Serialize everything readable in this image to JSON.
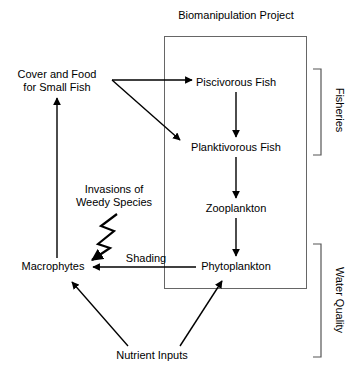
{
  "diagram": {
    "title": "Biomanipulation Project",
    "nodes": [
      {
        "id": "cover_food",
        "label": "Cover and Food\nfor Small Fish",
        "x": 57,
        "y": 81
      },
      {
        "id": "invasions",
        "label": "Invasions of\nWeedy Species",
        "x": 114,
        "y": 196
      },
      {
        "id": "macrophytes",
        "label": "Macrophytes",
        "x": 53,
        "y": 266
      },
      {
        "id": "nutrient_inputs",
        "label": "Nutrient Inputs",
        "x": 152,
        "y": 355
      },
      {
        "id": "piscivorous",
        "label": "Piscivorous Fish",
        "x": 236,
        "y": 82
      },
      {
        "id": "planktivorous",
        "label": "Planktivorous Fish",
        "x": 236,
        "y": 147
      },
      {
        "id": "zooplankton",
        "label": "Zooplankton",
        "x": 236,
        "y": 208
      },
      {
        "id": "phytoplankton",
        "label": "Phytoplankton",
        "x": 236,
        "y": 266
      }
    ],
    "edge_labels": [
      {
        "id": "shading",
        "label": "Shading",
        "x": 146,
        "y": 258
      }
    ],
    "brackets": [
      {
        "id": "fisheries",
        "label": "Fisheries",
        "label_x": 340,
        "label_y": 110
      },
      {
        "id": "water_quality",
        "label": "Water Quality",
        "label_x": 340,
        "label_y": 300
      }
    ],
    "edges": [
      {
        "from": "cover_food",
        "to": "piscivorous",
        "kind": "straight"
      },
      {
        "from": "cover_food",
        "to": "planktivorous",
        "kind": "straight"
      },
      {
        "from": "piscivorous",
        "to": "planktivorous",
        "kind": "straight"
      },
      {
        "from": "planktivorous",
        "to": "zooplankton",
        "kind": "straight"
      },
      {
        "from": "zooplankton",
        "to": "phytoplankton",
        "kind": "straight"
      },
      {
        "from": "phytoplankton",
        "to": "macrophytes",
        "kind": "straight",
        "label": "Shading"
      },
      {
        "from": "macrophytes",
        "to": "cover_food",
        "kind": "straight"
      },
      {
        "from": "invasions",
        "to": "macrophytes",
        "kind": "zigzag"
      },
      {
        "from": "nutrient_inputs",
        "to": "macrophytes",
        "kind": "straight"
      },
      {
        "from": "nutrient_inputs",
        "to": "phytoplankton",
        "kind": "straight"
      }
    ],
    "colors": {
      "stroke": "#000000",
      "text": "#000000",
      "box_stroke": "#555555",
      "background": "#ffffff"
    }
  }
}
